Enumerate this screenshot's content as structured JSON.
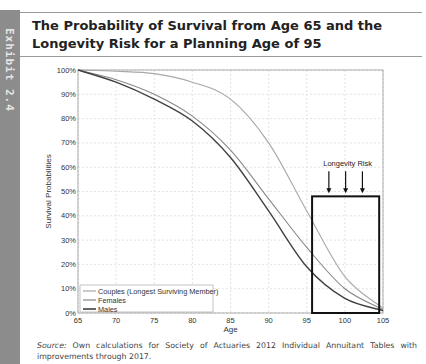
{
  "exhibit": {
    "label": "Exhibit 2.4"
  },
  "title": "The Probability of Survival from Age 65 and the Longevity Risk for a Planning Age of 95",
  "source": {
    "prefix": "Source:",
    "text": " Own calculations for Society of Actuaries 2012 Individual Annuitant Tables with improvements through 2017."
  },
  "chart_data": {
    "type": "line",
    "title": "The Probability of Survival from Age 65 and the Longevity Risk for a Planning Age of 95",
    "xlabel": "Age",
    "ylabel": "Survival Probabilities",
    "xlim": [
      65,
      105
    ],
    "ylim": [
      0,
      100
    ],
    "x_ticks": [
      "65",
      "70",
      "75",
      "80",
      "85",
      "90",
      "95",
      "100",
      "105"
    ],
    "y_ticks": [
      "0%",
      "10%",
      "20%",
      "30%",
      "40%",
      "50%",
      "60%",
      "70%",
      "80%",
      "90%",
      "100%"
    ],
    "grid": true,
    "legend_position": "lower left",
    "x": [
      65,
      70,
      75,
      80,
      85,
      90,
      95,
      100,
      105
    ],
    "series": [
      {
        "name": "Couples (Longest Surviving Member)",
        "color": "#a8a8a8",
        "values": [
          100,
          99.5,
          98.5,
          95,
          88,
          70,
          42,
          15,
          2
        ]
      },
      {
        "name": "Females",
        "color": "#888888",
        "values": [
          100,
          96,
          90,
          81,
          67,
          47,
          27,
          10,
          1.5
        ]
      },
      {
        "name": "Males",
        "color": "#404040",
        "values": [
          100,
          95,
          88,
          79,
          64,
          42,
          19,
          6,
          1
        ]
      }
    ],
    "annotations": [
      {
        "type": "box",
        "label": "Longevity Risk",
        "x_range": [
          95.7,
          104.5
        ],
        "y_range": [
          0,
          48
        ]
      },
      {
        "type": "arrows",
        "count": 3,
        "direction": "down"
      }
    ]
  }
}
